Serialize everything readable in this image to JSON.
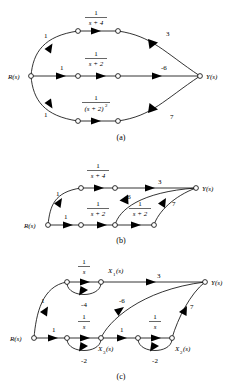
{
  "figure": {
    "type": "signal-flow-graph",
    "panels": [
      {
        "id": "a",
        "caption": "(a)",
        "input_label": "R(s)",
        "output_label": "Y(s)",
        "description": "Three parallel forward paths from R(s) to Y(s)",
        "paths": [
          {
            "name": "top-path",
            "gains": [
              "1",
              "1/(s + 4)",
              "3"
            ]
          },
          {
            "name": "middle-path",
            "gains": [
              "1",
              "1/(s + 2)",
              "-6"
            ]
          },
          {
            "name": "bottom-path",
            "gains": [
              "1",
              "1/(s + 2)^2",
              "7"
            ]
          }
        ],
        "edge_labels": [
          "1",
          "1",
          "1",
          "3",
          "-6",
          "7"
        ],
        "transfer_labels": [
          {
            "num": "1",
            "den": "s + 4"
          },
          {
            "num": "1",
            "den": "s + 2"
          },
          {
            "num": "1",
            "den": "(s + 2)"
          }
        ],
        "bottom_den_exponent": "2"
      },
      {
        "id": "b",
        "caption": "(b)",
        "input_label": "R(s)",
        "output_label": "Y(s)",
        "description": "Rearranged graph with cascaded 1/(s + 2) blocks",
        "edge_labels": [
          "1",
          "1",
          "3",
          "-6",
          "7"
        ],
        "transfer_labels": [
          {
            "num": "1",
            "den": "s + 4"
          },
          {
            "num": "1",
            "den": "s + 2"
          },
          {
            "num": "1",
            "den": "s + 2"
          }
        ]
      },
      {
        "id": "c",
        "caption": "(c)",
        "input_label": "R(s)",
        "output_label": "Y(s)",
        "description": "State-variable signal flow graph with integrators 1/s and feedback gains",
        "state_labels": [
          "X_1(s)",
          "X_3(s)",
          "X_2(s)"
        ],
        "state_label_x1": {
          "base": "X",
          "sub": "1",
          "arg": "(s)"
        },
        "state_label_x3": {
          "base": "X",
          "sub": "3",
          "arg": "(s)"
        },
        "state_label_x2": {
          "base": "X",
          "sub": "2",
          "arg": "(s)"
        },
        "edge_labels": [
          "1",
          "1",
          "1",
          "3",
          "-6",
          "7"
        ],
        "feedback_labels": [
          "-4",
          "-2",
          "-2"
        ],
        "integrator_labels": [
          {
            "num": "1",
            "den": "s"
          },
          {
            "num": "1",
            "den": "s"
          },
          {
            "num": "1",
            "den": "s"
          }
        ]
      }
    ]
  },
  "colors": {
    "ink": "#000000",
    "paper": "#ffffff"
  }
}
